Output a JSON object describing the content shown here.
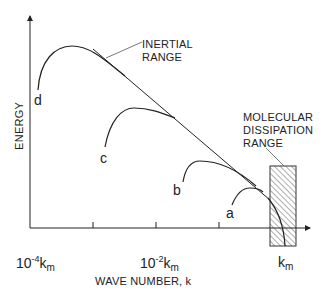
{
  "diagram": {
    "y_axis_label": "ENERGY",
    "x_axis_label": "WAVE NUMBER, k",
    "x_tick_labels": [
      {
        "base": "10",
        "exp": "-4",
        "unit": "k",
        "sub": "m"
      },
      {
        "base": "10",
        "exp": "-2",
        "unit": "k",
        "sub": "m"
      },
      {
        "base": "",
        "exp": "",
        "unit": "k",
        "sub": "m"
      }
    ],
    "annotations": {
      "inertial_line1": "INERTIAL",
      "inertial_line2": "RANGE",
      "molecular_line1": "MOLECULAR",
      "molecular_line2": "DISSIPATION",
      "molecular_line3": "RANGE"
    },
    "curves": [
      {
        "label": "d"
      },
      {
        "label": "c"
      },
      {
        "label": "b"
      },
      {
        "label": "a"
      }
    ],
    "colors": {
      "ink": "#222222",
      "background": "#ffffff"
    }
  }
}
